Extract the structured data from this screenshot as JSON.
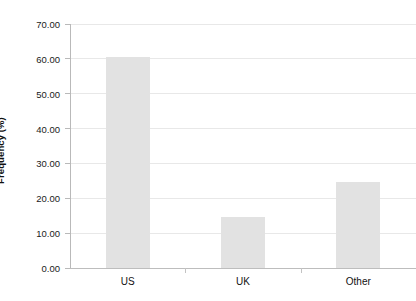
{
  "chart_data": {
    "type": "bar",
    "title": "",
    "xlabel": "",
    "ylabel": "Frequency (%)",
    "categories": [
      "US",
      "UK",
      "Other"
    ],
    "values": [
      60.5,
      14.5,
      24.7
    ],
    "ylim": [
      0,
      70
    ],
    "ytick_step": 10,
    "ytick_labels": [
      "0.00",
      "10.00",
      "20.00",
      "30.00",
      "40.00",
      "50.00",
      "60.00",
      "70.00"
    ],
    "ytick_values": [
      0,
      10,
      20,
      30,
      40,
      50,
      60,
      70
    ],
    "grid": true,
    "legend": false,
    "legend_position": "none",
    "bar_color": "#e2e2e2",
    "gridline_color": "#e8e8e8",
    "axis_color": "#b9b9b9",
    "text_color": "#111111",
    "background_color": "#ffffff"
  }
}
